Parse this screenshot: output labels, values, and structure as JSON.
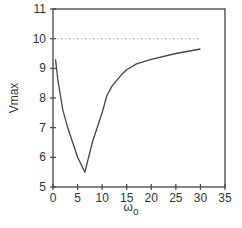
{
  "chart_data": {
    "type": "line",
    "title": "",
    "xlabel": "ω",
    "xlabel_sub": "o",
    "ylabel": "Vmax",
    "xlim": [
      0,
      35
    ],
    "ylim": [
      5,
      11
    ],
    "xticks": [
      0,
      5,
      10,
      15,
      20,
      25,
      30,
      35
    ],
    "yticks": [
      5,
      6,
      7,
      8,
      9,
      10,
      11
    ],
    "grid": false,
    "legend": null,
    "series": [
      {
        "name": "Vmax",
        "style": "solid",
        "x": [
          0.5,
          1,
          2,
          3,
          4,
          5,
          6.5,
          8,
          10,
          11,
          12,
          13,
          14,
          15,
          17,
          20,
          25,
          30
        ],
        "y": [
          9.3,
          8.6,
          7.6,
          7.0,
          6.5,
          6.0,
          5.5,
          6.5,
          7.5,
          8.1,
          8.4,
          8.6,
          8.8,
          8.95,
          9.15,
          9.3,
          9.5,
          9.65
        ]
      },
      {
        "name": "reference",
        "style": "dotted",
        "x": [
          0,
          30
        ],
        "y": [
          10,
          10
        ]
      }
    ]
  }
}
